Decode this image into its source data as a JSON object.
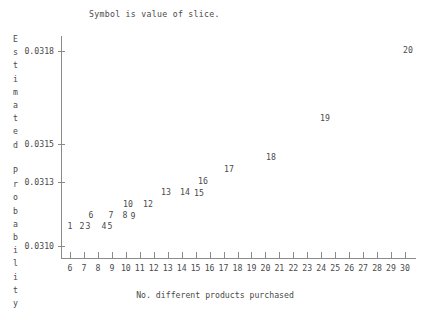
{
  "chart_data": {
    "type": "scatter",
    "title": "Symbol is value of slice.",
    "xlabel": "No. different products purchased",
    "ylabel": "Estimated Probability",
    "ylabel_lines": [
      "E",
      "s",
      "t",
      "i",
      "m",
      "a",
      "t",
      "e",
      "d",
      "",
      "P",
      "r",
      "o",
      "b",
      "a",
      "b",
      "i",
      "l",
      "i",
      "t",
      "y"
    ],
    "xlim": [
      6,
      30
    ],
    "ylim": [
      0.031,
      0.0318
    ],
    "grid": false,
    "legend": null,
    "xticks": [
      6,
      7,
      8,
      9,
      10,
      11,
      12,
      13,
      14,
      15,
      16,
      17,
      18,
      19,
      20,
      21,
      22,
      23,
      24,
      25,
      26,
      27,
      28,
      29,
      30
    ],
    "xtick_labels": [
      "6",
      "7",
      "8",
      "9",
      "10",
      "11",
      "12",
      "13",
      "14",
      "15",
      "16",
      "17",
      "18",
      "19",
      "20",
      "21",
      "22",
      "23",
      "24",
      "25",
      "26",
      "27",
      "28",
      "29",
      "30"
    ],
    "yticks": [
      0.031,
      0.0313,
      0.0315,
      0.0318
    ],
    "ytick_labels": [
      "0.0310",
      "0.0313",
      "0.0315",
      "0.0318"
    ],
    "point_marker": "text-label-is-slice-value",
    "points": [
      {
        "label": "1",
        "x": 6.0,
        "y": 0.03112,
        "px": 70,
        "py": 226
      },
      {
        "label": "2",
        "x": 6.9,
        "y": 0.03112,
        "px": 82,
        "py": 226
      },
      {
        "label": "3",
        "x": 7.3,
        "y": 0.03112,
        "px": 88,
        "py": 226
      },
      {
        "label": "4",
        "x": 8.5,
        "y": 0.03112,
        "px": 104,
        "py": 226
      },
      {
        "label": "5",
        "x": 8.9,
        "y": 0.03112,
        "px": 110,
        "py": 226
      },
      {
        "label": "6",
        "x": 7.5,
        "y": 0.03125,
        "px": 91,
        "py": 215
      },
      {
        "label": "7",
        "x": 8.9,
        "y": 0.03125,
        "px": 111,
        "py": 215
      },
      {
        "label": "8",
        "x": 9.9,
        "y": 0.03125,
        "px": 125,
        "py": 215
      },
      {
        "label": "9",
        "x": 10.5,
        "y": 0.03124,
        "px": 133,
        "py": 216
      },
      {
        "label": "10",
        "x": 10.2,
        "y": 0.03137,
        "px": 128,
        "py": 204
      },
      {
        "label": "12",
        "x": 11.6,
        "y": 0.03137,
        "px": 148,
        "py": 204
      },
      {
        "label": "13",
        "x": 12.9,
        "y": 0.03151,
        "px": 166,
        "py": 192
      },
      {
        "label": "14",
        "x": 14.2,
        "y": 0.03151,
        "px": 185,
        "py": 192
      },
      {
        "label": "15",
        "x": 15.2,
        "y": 0.0315,
        "px": 199,
        "py": 193
      },
      {
        "label": "16",
        "x": 15.5,
        "y": 0.03164,
        "px": 203,
        "py": 181
      },
      {
        "label": "17",
        "x": 17.4,
        "y": 0.03177,
        "px": 229,
        "py": 169
      },
      {
        "label": "18",
        "x": 20.4,
        "y": 0.03191,
        "px": 271,
        "py": 157
      },
      {
        "label": "19",
        "x": 24.3,
        "y": 0.03237,
        "px": 325,
        "py": 118
      },
      {
        "label": "20",
        "x": 30.2,
        "y": 0.03317,
        "px": 408,
        "py": 50
      }
    ],
    "axis_color": "#8a8a8a",
    "text_color": "#4a4a4a",
    "background": "#ffffff"
  }
}
